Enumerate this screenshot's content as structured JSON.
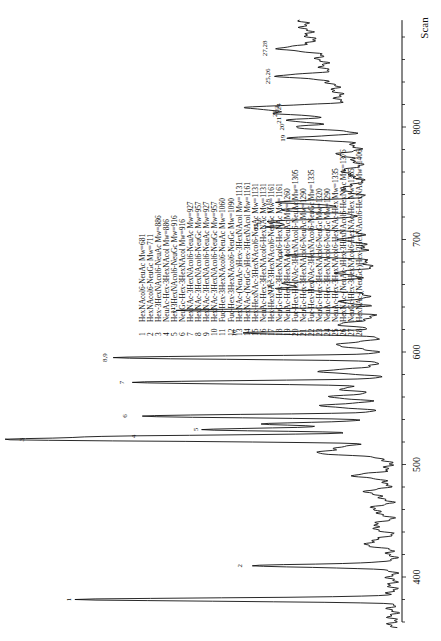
{
  "chart_data": {
    "type": "line",
    "title": "",
    "orientation": "rotated-90 (scan axis vertical on right, increasing upward; intensity extends leftward)",
    "xlabel": "Scan",
    "ylabel": "",
    "xlim": [
      350,
      900
    ],
    "xticks": [
      400,
      500,
      600,
      700,
      800
    ],
    "grid": false,
    "peaks": [
      {
        "label": "1",
        "scan": 380,
        "rel_intensity": 0.86
      },
      {
        "label": "2",
        "scan": 410,
        "rel_intensity": 0.39
      },
      {
        "label": "3",
        "scan": 522,
        "rel_intensity": 0.97
      },
      {
        "label": "4",
        "scan": 525,
        "rel_intensity": 0.66
      },
      {
        "label": "5",
        "scan": 531,
        "rel_intensity": 0.49
      },
      {
        "label": "6",
        "scan": 543,
        "rel_intensity": 0.68
      },
      {
        "label": "7",
        "scan": 573,
        "rel_intensity": 0.68
      },
      {
        "label": "8,9",
        "scan": 595,
        "rel_intensity": 0.72
      },
      {
        "label": "10",
        "scan": 617,
        "rel_intensity": 0.36
      },
      {
        "label": "11",
        "scan": 637,
        "rel_intensity": 0.52
      },
      {
        "label": "12",
        "scan": 656,
        "rel_intensity": 0.25
      },
      {
        "label": "13",
        "scan": 661,
        "rel_intensity": 0.25
      },
      {
        "label": "14",
        "scan": 686,
        "rel_intensity": 0.21
      },
      {
        "label": "15",
        "scan": 711,
        "rel_intensity": 0.27
      },
      {
        "label": "16",
        "scan": 716,
        "rel_intensity": 0.26
      },
      {
        "label": "17",
        "scan": 726,
        "rel_intensity": 0.23
      },
      {
        "label": "18",
        "scan": 733,
        "rel_intensity": 0.23
      },
      {
        "label": "19",
        "scan": 790,
        "rel_intensity": 0.17
      },
      {
        "label": "20",
        "scan": 800,
        "rel_intensity": 0.17
      },
      {
        "label": "21",
        "scan": 806,
        "rel_intensity": 0.17
      },
      {
        "label": "22",
        "scan": 812,
        "rel_intensity": 0.17
      },
      {
        "label": "23",
        "scan": 816,
        "rel_intensity": 0.16
      },
      {
        "label": "24",
        "scan": 818,
        "rel_intensity": 0.15
      },
      {
        "label": "25,26",
        "scan": 845,
        "rel_intensity": 0.14
      },
      {
        "label": "27,28",
        "scan": 870,
        "rel_intensity": 0.11
      }
    ],
    "legend": [
      {
        "num": "1",
        "text": "HexNAcol6-NeuAc Mw=681"
      },
      {
        "num": "2",
        "text": "HexNAcol6-NeuGc Mw=711"
      },
      {
        "num": "3",
        "text": "Hex-3HexNAcol6-NeuAc Mw=886"
      },
      {
        "num": "4",
        "text": "NeuAc-Hex-3HexNAcol Mw=886"
      },
      {
        "num": "5",
        "text": "Hex-3HexNAcol6-NeuGc Mw=916"
      },
      {
        "num": "6",
        "text": "NeuGc-Hex-3HexNAcol Mw=916"
      },
      {
        "num": "7",
        "text": "HexNAc-3HexNAcol6-NeuAc Mw=927"
      },
      {
        "num": "8",
        "text": "HexNAc-3HexNAcol6-NeuGc Mw=957"
      },
      {
        "num": "9",
        "text": "HexNAc-3HexNAcol6-NeuAc Mw=927"
      },
      {
        "num": "10",
        "text": "HexNAc-3HexNAcol6-NeuGc Mw=957"
      },
      {
        "num": "11",
        "text": "Fuc-Hex-3HexNAcol6-NeuAc Mw=1060"
      },
      {
        "num": "12",
        "text": "Fuc-Hex-3HexNAcol6-NeuGc Mw=1090"
      },
      {
        "num": "13",
        "text": "HexNAc-(NeuAc-)Hex-3HexNAcol Mw=1131"
      },
      {
        "num": "14",
        "text": "HexNAc-(NeuGc-)Hex-3HexNAcol Mw=1161"
      },
      {
        "num": "15",
        "text": "Hex-HexNAc-3HexNAcol6-NeuAc Mw=1131"
      },
      {
        "num": "16",
        "text": "NeuAc-Hex-3HexNAcol6-HexNAc Mw=1131"
      },
      {
        "num": "17",
        "text": "Hex-HexNAc-3HexNAcol6-NeuGc Mw=1161"
      },
      {
        "num": "18",
        "text": "NeuGc-Hex-3HexNAcol6-HexNAc Mw=1161"
      },
      {
        "num": "19",
        "text": "NeuAc-Hex-3HexNAcol6-NeuAc Mw=1260"
      },
      {
        "num": "20",
        "text": "Fuc-Hex-HexNAc-3HexNAcol6-NeuAc Mw=1305"
      },
      {
        "num": "21",
        "text": "NeuGc-Hex-3HexNAcol6-NeuAc Mw=1290"
      },
      {
        "num": "22",
        "text": "Fuc-Hex-HexNAc-3HexNAcol6-NeuGc Mw=1335"
      },
      {
        "num": "23",
        "text": "NeuGc-Hex-3HexNAcol6-NeuGc Mw=1320"
      },
      {
        "num": "24",
        "text": "NeuAc-Hex-3HexNAcol6-NeuGc Mw=1290"
      },
      {
        "num": "25",
        "text": "NeuAc-Hex-3HexNAcol6-HexNAc-Hex Mw=1335"
      },
      {
        "num": "26",
        "text": "HexNAc-(NeuAc-)Hex-3HexNAcol6-HexNAc Mw=1376"
      },
      {
        "num": "27",
        "text": "NeuGc-Hex-3HexNAcol6-HexNAc-Hex Mw=1365"
      },
      {
        "num": "28",
        "text": "HexNAc-(NeuGc-)Hex-3HexNAcol6-HexNAc Mw=1406"
      }
    ]
  },
  "axis": {
    "title": "Scan",
    "ticks": [
      "400",
      "500",
      "600",
      "700",
      "800"
    ]
  },
  "colors": {
    "ink": "#111111",
    "background": "#ffffff"
  }
}
